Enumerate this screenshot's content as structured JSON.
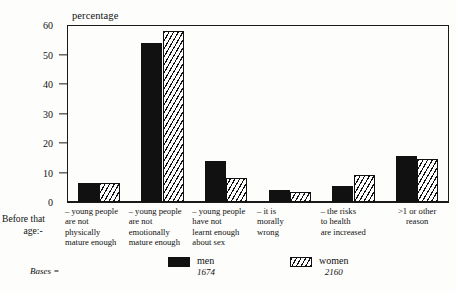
{
  "chart_data": {
    "type": "bar",
    "title": "",
    "ylabel": "percentage",
    "xlabel": "",
    "ylim": [
      0,
      60
    ],
    "yticks": [
      0,
      10,
      20,
      30,
      40,
      50,
      60
    ],
    "grid": false,
    "legend_position": "bottom-center",
    "categories": [
      "– young people\nare not\nphysically\nmature enough",
      "– young people\nare not\nemotionally\nmature enough",
      "– young people\nhave not\nlearnt enough\nabout sex",
      "– it is\nmorally\nwrong",
      "– the risks\nto health\nare increased",
      ">1 or other\nreason"
    ],
    "series": [
      {
        "name": "men",
        "base": "1674",
        "values": [
          6.5,
          54,
          14,
          4,
          5.5,
          15.5
        ]
      },
      {
        "name": "women",
        "base": "2160",
        "values": [
          6.5,
          58,
          8,
          3.5,
          9,
          14.5
        ]
      }
    ],
    "axis_caption": "Before that\nage:-",
    "bases_label": "Bases ="
  },
  "labels": {
    "axis_title": "percentage",
    "axis_caption_line1": "Before that",
    "axis_caption_line2": "age:-",
    "bases": "Bases ="
  },
  "colors": {
    "men_fill": "#111111",
    "women_fill": "#ffffff",
    "hatch": "#111111",
    "axis": "#1a1a1a",
    "background": "#fdfdfb"
  }
}
